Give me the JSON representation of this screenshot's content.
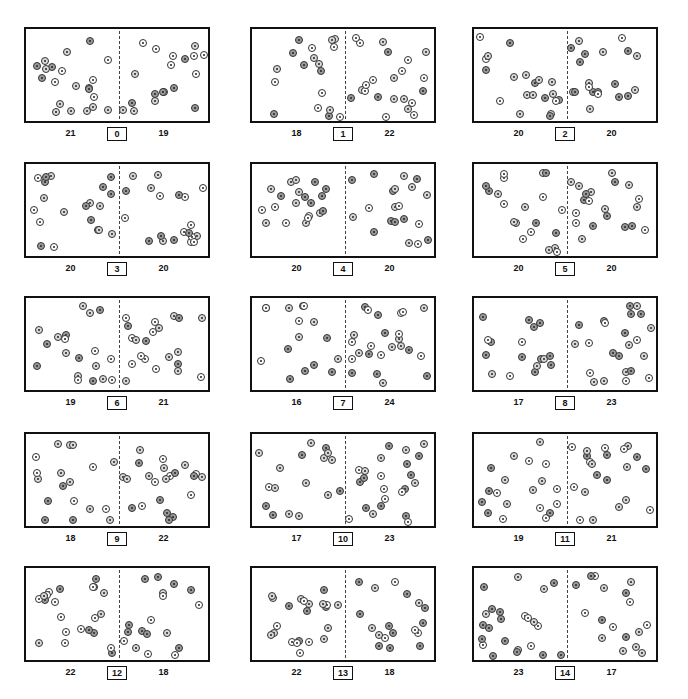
{
  "chart_data": {
    "type": "scatter",
    "title": "",
    "layout": {
      "rows": 5,
      "cols": 3
    },
    "panels": [
      {
        "index": "0",
        "left": "21",
        "right": "19"
      },
      {
        "index": "1",
        "left": "18",
        "right": "22"
      },
      {
        "index": "2",
        "left": "20",
        "right": "20"
      },
      {
        "index": "3",
        "left": "20",
        "right": "20"
      },
      {
        "index": "4",
        "left": "20",
        "right": "20"
      },
      {
        "index": "5",
        "left": "20",
        "right": "20"
      },
      {
        "index": "6",
        "left": "19",
        "right": "21"
      },
      {
        "index": "7",
        "left": "16",
        "right": "24"
      },
      {
        "index": "8",
        "left": "17",
        "right": "23"
      },
      {
        "index": "9",
        "left": "18",
        "right": "22"
      },
      {
        "index": "10",
        "left": "17",
        "right": "23"
      },
      {
        "index": "11",
        "left": "19",
        "right": "21"
      },
      {
        "index": "12",
        "left": "22",
        "right": "18"
      },
      {
        "index": "13",
        "left": "22",
        "right": "18"
      },
      {
        "index": "14",
        "left": "23",
        "right": "17"
      }
    ]
  },
  "geometry": {
    "cols_x": [
      24,
      250,
      472
    ],
    "rows_y": [
      27,
      162,
      296,
      432,
      566
    ],
    "box_w": [
      186,
      186,
      186
    ],
    "box_h": 96
  }
}
